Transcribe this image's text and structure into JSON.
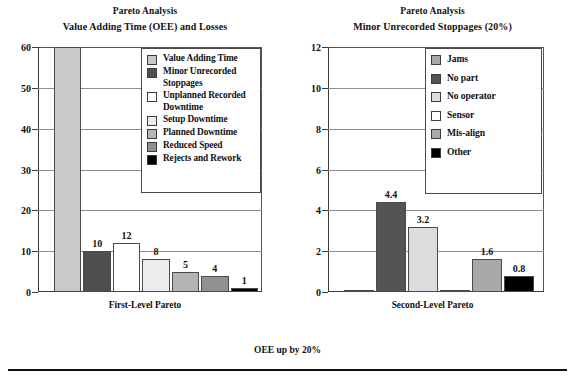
{
  "footer": {
    "note": "OEE up by 20%"
  },
  "charts": [
    {
      "id": "first-level-pareto",
      "title": "Pareto Analysis",
      "subtitle": "Value Adding Time (OEE) and Losses",
      "caption": "First-Level Pareto",
      "legend_title": "",
      "chart_data": {
        "type": "bar",
        "title": "Pareto Analysis — Value Adding Time (OEE) and Losses",
        "xlabel": "First-Level Pareto",
        "ylabel": "",
        "ylim": [
          0,
          60
        ],
        "yticks": [
          0,
          10,
          20,
          30,
          40,
          50,
          60
        ],
        "grid": true,
        "legend_position": "inside-top-right",
        "categories": [
          "Value Adding Time",
          "Minor Unrecorded Stoppages",
          "Unplanned Recorded Downtime",
          "Setup Downtime",
          "Planned Downtime",
          "Reduced Speed",
          "Rejects and Rework"
        ],
        "values": [
          60,
          10,
          12,
          8,
          5,
          4,
          1
        ],
        "value_labels": [
          "",
          "10",
          "12",
          "8",
          "5",
          "4",
          "1"
        ],
        "colors": [
          "#c9c9c9",
          "#4f4f4f",
          "#ffffff",
          "#ededed",
          "#b4b4b4",
          "#919191",
          "#000000"
        ]
      }
    },
    {
      "id": "second-level-pareto",
      "title": "Pareto Analysis",
      "subtitle": "Minor Unrecorded Stoppages (20%)",
      "caption": "Second-Level Pareto",
      "legend_title": "",
      "chart_data": {
        "type": "bar",
        "title": "Pareto Analysis — Minor Unrecorded Stoppages (20%)",
        "xlabel": "Second-Level Pareto",
        "ylabel": "",
        "ylim": [
          0,
          12
        ],
        "yticks": [
          0,
          2,
          4,
          6,
          8,
          10,
          12
        ],
        "grid": true,
        "legend_position": "inside-top-right",
        "categories": [
          "Jams",
          "No part",
          "No operator",
          "Sensor",
          "Mis-align",
          "Other"
        ],
        "values": [
          0.1,
          4.4,
          3.2,
          0.1,
          1.6,
          0.8
        ],
        "value_labels": [
          "",
          "4.4",
          "3.2",
          "",
          "1.6",
          "0.8"
        ],
        "colors": [
          "#a8a8a8",
          "#545454",
          "#dcdcdc",
          "#ffffff",
          "#a9a9a9",
          "#000000"
        ]
      }
    }
  ]
}
